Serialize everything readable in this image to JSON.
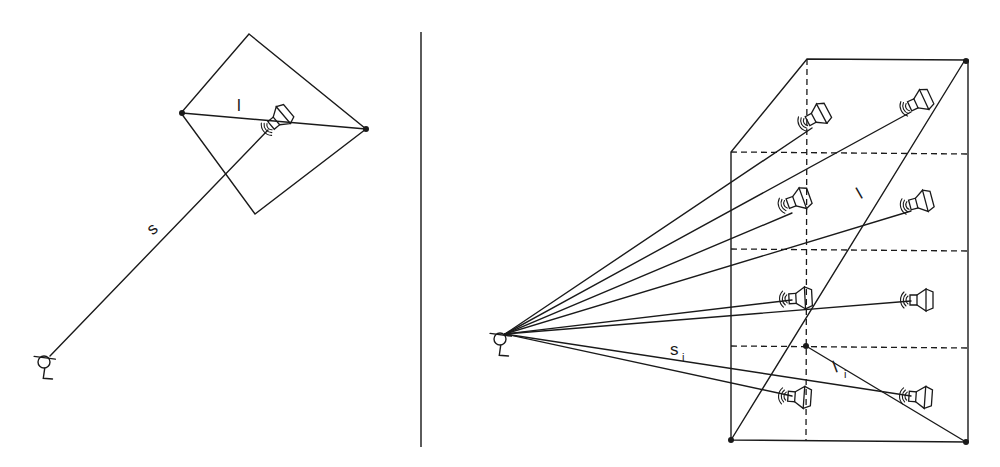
{
  "left_diagram": {
    "label_s": "s",
    "label_l": "l"
  },
  "right_diagram": {
    "label_s": "s",
    "label_s_sub": "i",
    "label_l": "l",
    "label_l_i": "l",
    "label_l_i_sub": "i"
  },
  "colors": {
    "ink": "#1a1a1a",
    "background": "#ffffff"
  }
}
